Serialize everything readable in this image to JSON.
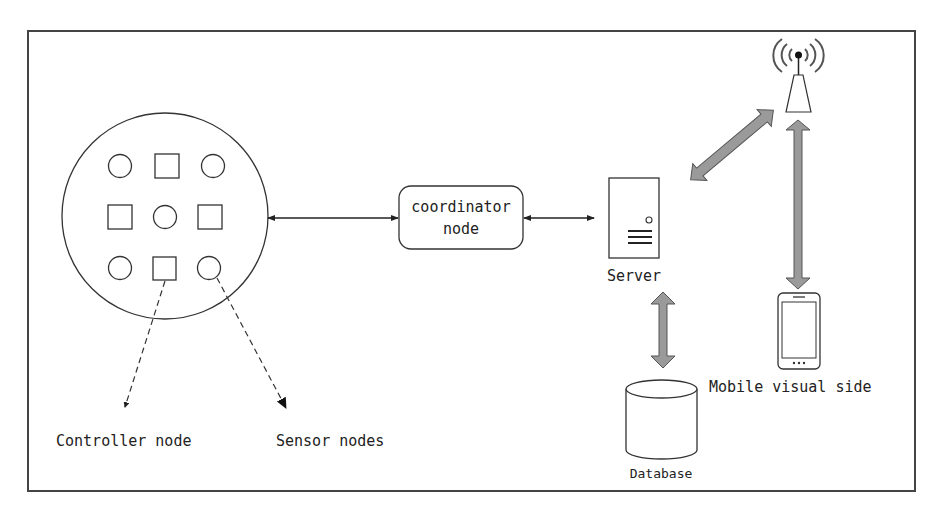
{
  "diagram": {
    "type": "system-architecture",
    "nodes": {
      "sensor_cluster": {
        "label": "",
        "shapes": [
          "circle",
          "square",
          "circle",
          "square",
          "circle",
          "square",
          "circle",
          "square",
          "circle"
        ]
      },
      "coordinator": {
        "label_line1": "coordinator",
        "label_line2": "node"
      },
      "server": {
        "label": "Server"
      },
      "database": {
        "label": "Database"
      },
      "base_station": {
        "label": ""
      },
      "mobile": {
        "label": "Mobile visual side"
      }
    },
    "legend": {
      "controller": "Controller node",
      "sensor": "Sensor nodes"
    },
    "edges": [
      {
        "from": "sensor_cluster",
        "to": "coordinator",
        "style": "thin-bidirectional"
      },
      {
        "from": "coordinator",
        "to": "server",
        "style": "thin-bidirectional"
      },
      {
        "from": "server",
        "to": "database",
        "style": "thick-bidirectional"
      },
      {
        "from": "server",
        "to": "base_station",
        "style": "thick-bidirectional"
      },
      {
        "from": "base_station",
        "to": "mobile",
        "style": "thick-bidirectional"
      },
      {
        "from": "controller_square",
        "to": "legend.controller",
        "style": "dashed"
      },
      {
        "from": "sensor_circle",
        "to": "legend.sensor",
        "style": "dashed"
      }
    ],
    "colors": {
      "stroke": "#333333",
      "thick_arrow_fill": "#9a9a9a",
      "background": "#ffffff"
    }
  }
}
